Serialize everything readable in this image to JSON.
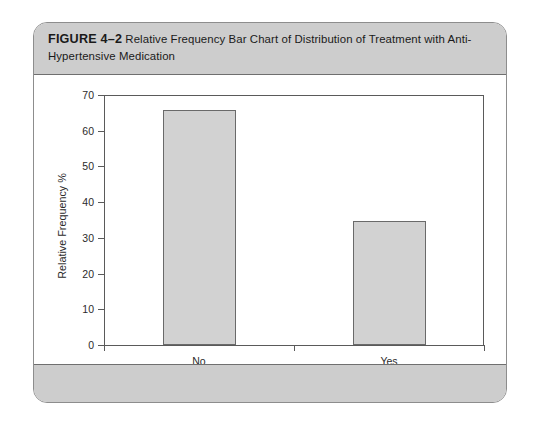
{
  "figure": {
    "number_label": "FIGURE 4–2",
    "caption": "Relative Frequency Bar Chart of Distribution of Treatment with Anti-Hypertensive Medication"
  },
  "chart_data": {
    "type": "bar",
    "title": "Relative Frequency Bar Chart of Distribution of Treatment with Anti-Hypertensive Medication",
    "categories": [
      "No",
      "Yes"
    ],
    "values": [
      65.7,
      34.8
    ],
    "xlabel": "Treatment with Anti-hypertensives",
    "ylabel": "Relative Frequency %",
    "ylim": [
      0,
      70
    ],
    "yticks": [
      0,
      10,
      20,
      30,
      40,
      50,
      60,
      70
    ],
    "ytick_labels": [
      "0",
      "10",
      "20",
      "30",
      "40",
      "50",
      "60",
      "70"
    ],
    "grid": false,
    "legend": null,
    "bar_fill_color": "#d2d2d2",
    "bar_edge_color": "#6a6a6a",
    "axis_color": "#5a5a5a"
  },
  "style": {
    "card_border_color": "#8d8d8d",
    "band_color": "#cdcdcd",
    "page_background": "#ffffff"
  }
}
